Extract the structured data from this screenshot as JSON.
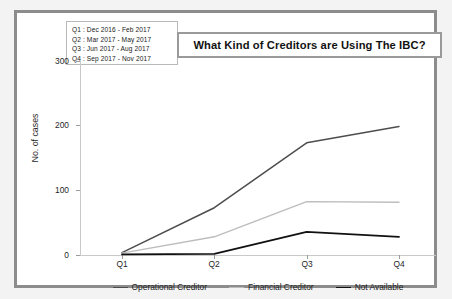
{
  "title": "What Kind of Creditors are Using The IBC?",
  "quarter_key": [
    "Q1 : Dec 2016 - Feb 2017",
    "Q2 : Mar 2017 - May 2017",
    "Q3 : Jun 2017 - Aug 2017",
    "Q4 : Sep 2017 - Nov 2017"
  ],
  "colors": {
    "operational_creditor": "#4d4d4d",
    "financial_creditor": "#bdbdbd",
    "not_available": "#111111",
    "frame": "#8c8c8c",
    "axis": "#c9c9c9",
    "background": "#ffffff"
  },
  "chart_data": {
    "type": "line",
    "title": "What Kind of Creditors are Using The IBC?",
    "xlabel": "",
    "ylabel": "No. of cases",
    "categories": [
      "Q1",
      "Q2",
      "Q3",
      "Q4"
    ],
    "xtick_labels": [
      "Q1",
      "Q2",
      "Q3",
      "Q4"
    ],
    "ytick_labels": [
      "0",
      "100",
      "200",
      "300"
    ],
    "yticks": [
      0,
      100,
      200,
      300
    ],
    "ylim": [
      0,
      320
    ],
    "grid": false,
    "legend_position": "bottom",
    "series": [
      {
        "name": "Operational Creditor",
        "values": [
          4,
          78,
          185,
          212
        ],
        "color": "#4d4d4d"
      },
      {
        "name": "Financial Creditor",
        "values": [
          3,
          30,
          88,
          87
        ],
        "color": "#bdbdbd"
      },
      {
        "name": "Not Available",
        "values": [
          1,
          2,
          38,
          30
        ],
        "color": "#111111"
      }
    ]
  }
}
